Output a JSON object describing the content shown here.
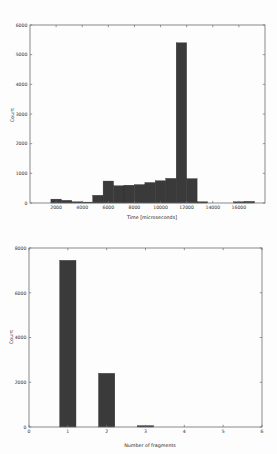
{
  "document": {
    "background_color": "#fdfdfd",
    "bar_color": "#3a3a3a",
    "axis_color": "#6b6b6b",
    "text_color": "#2e2e2e"
  },
  "chart_data": [
    {
      "type": "bar",
      "id": "time-histogram",
      "title": "",
      "xlabel": "Time [microseconds]",
      "ylabel": "Count",
      "xlim": [
        0,
        18000
      ],
      "ylim": [
        0,
        6000
      ],
      "xticks": [
        2000,
        4000,
        6000,
        8000,
        10000,
        12000,
        14000,
        16000
      ],
      "xtick_labels": [
        "2000",
        "4000",
        "6000",
        "8000",
        "10000",
        "12000",
        "14000",
        "16000"
      ],
      "yticks": [
        0,
        1000,
        2000,
        3000,
        4000,
        5000,
        6000
      ],
      "ytick_labels": [
        "0",
        "1000",
        "2000",
        "3000",
        "4000",
        "5000",
        "6000"
      ],
      "grid": false,
      "legend": "none",
      "bin_width": 800,
      "bin_starts": [
        1600,
        2400,
        3200,
        4000,
        4800,
        5600,
        6400,
        7200,
        8000,
        8800,
        9600,
        10400,
        11200,
        12000,
        12800,
        15600,
        16400
      ],
      "values": [
        130,
        90,
        40,
        30,
        260,
        740,
        580,
        600,
        620,
        690,
        750,
        830,
        5400,
        820,
        40,
        40,
        55
      ],
      "categories": [
        "1600",
        "2400",
        "3200",
        "4000",
        "4800",
        "5600",
        "6400",
        "7200",
        "8000",
        "8800",
        "9600",
        "10400",
        "11200",
        "12000",
        "12800",
        "15600",
        "16400"
      ]
    },
    {
      "type": "bar",
      "id": "fragment-count-histogram",
      "title": "",
      "xlabel": "Number of fragments",
      "ylabel": "Count",
      "xlim": [
        0,
        6
      ],
      "ylim": [
        0,
        8000
      ],
      "xticks": [
        0,
        1,
        2,
        3,
        4,
        5,
        6
      ],
      "xtick_labels": [
        "0",
        "1",
        "2",
        "3",
        "4",
        "5",
        "6"
      ],
      "yticks": [
        0,
        2000,
        4000,
        6000,
        8000
      ],
      "ytick_labels": [
        "0",
        "2000",
        "4000",
        "6000",
        "8000"
      ],
      "grid": false,
      "legend": "none",
      "bar_width": 0.42,
      "categories": [
        "1",
        "2",
        "3"
      ],
      "values": [
        7450,
        2400,
        60
      ]
    }
  ]
}
